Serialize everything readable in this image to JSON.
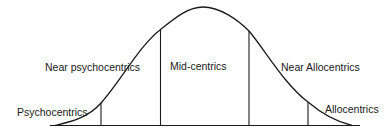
{
  "diagram": {
    "type": "bell-curve-segmentation",
    "line_color": "#1a1a1a",
    "background": "#ffffff",
    "segments": [
      {
        "id": "psychocentrics",
        "label": "Psychocentrics"
      },
      {
        "id": "near-psychocentrics",
        "label": "Near psychocentrics"
      },
      {
        "id": "mid-centrics",
        "label": "Mid-centrics"
      },
      {
        "id": "near-allocentrics",
        "label": "Near Allocentrics"
      },
      {
        "id": "allocentrics",
        "label": "Allocentrics"
      }
    ],
    "dividers": 4
  }
}
